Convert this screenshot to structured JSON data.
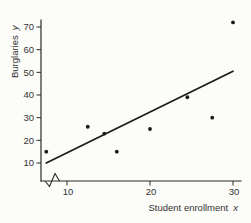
{
  "figure": {
    "ylabel_main": "Burglaries",
    "ylabel_var": "y",
    "xlabel_main": "Student enrollment",
    "xlabel_var": "x"
  },
  "chart_data": {
    "type": "scatter",
    "title": "",
    "xlabel": "Student enrollment x",
    "ylabel": "Burglaries y",
    "x_ticks": [
      10,
      20,
      30
    ],
    "y_ticks": [
      10,
      20,
      30,
      40,
      50,
      60,
      70
    ],
    "xlim": [
      7,
      31
    ],
    "ylim": [
      0,
      75
    ],
    "x_axis_break": true,
    "grid": false,
    "legend": "none",
    "points": [
      {
        "x": 7.5,
        "y": 15
      },
      {
        "x": 12.5,
        "y": 26
      },
      {
        "x": 14.5,
        "y": 23
      },
      {
        "x": 16,
        "y": 15
      },
      {
        "x": 20,
        "y": 25
      },
      {
        "x": 24.5,
        "y": 39
      },
      {
        "x": 27.5,
        "y": 30
      },
      {
        "x": 30,
        "y": 72
      }
    ],
    "trend_line": {
      "x1": 7.5,
      "y1": 10,
      "x2": 30,
      "y2": 50.5
    },
    "colors": {
      "point": "#1a1a1a",
      "trend": "#1a1a1a",
      "axis": "#2b2b2b",
      "text": "#333333",
      "background": "#fcfcf9"
    }
  }
}
